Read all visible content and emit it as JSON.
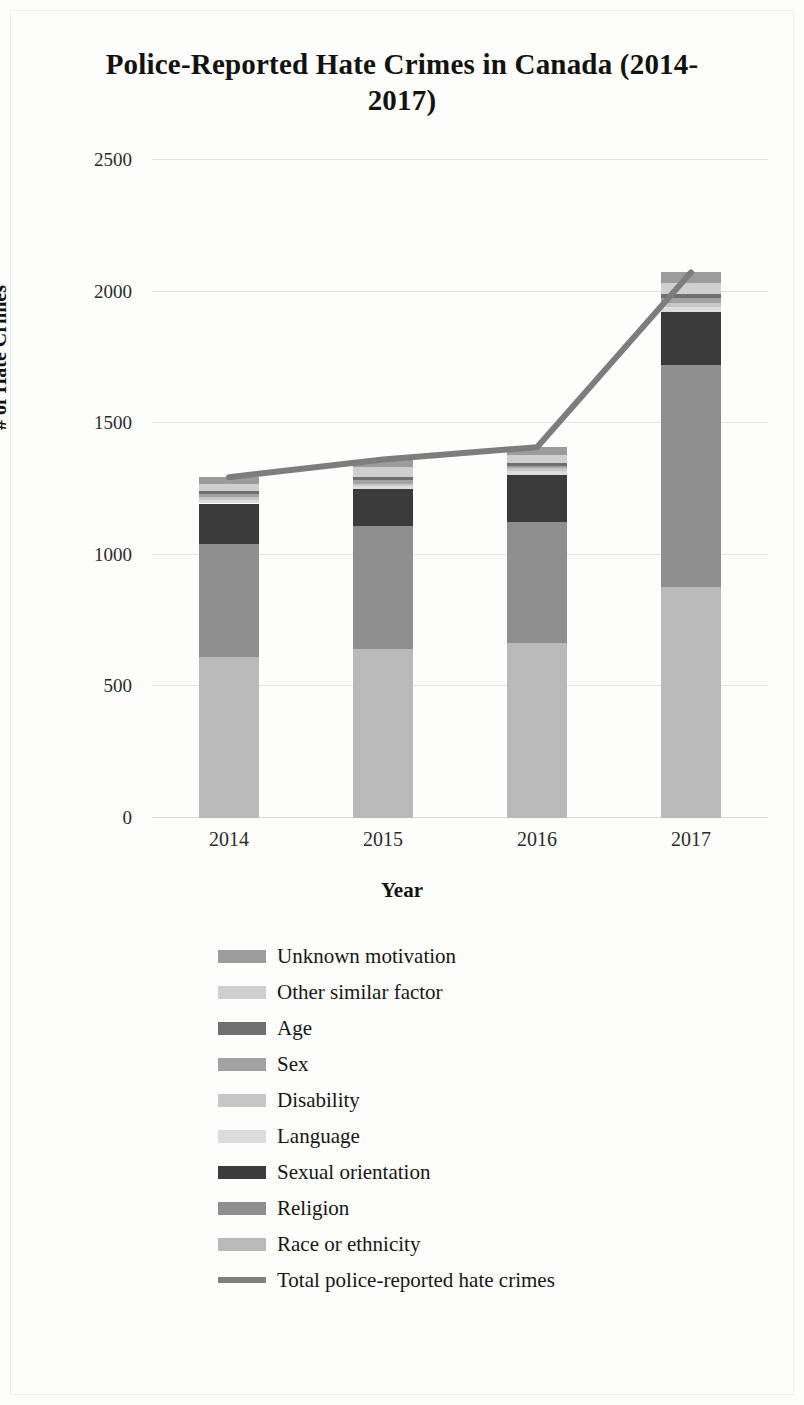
{
  "chart_data": {
    "type": "bar",
    "subtype": "stacked-bar-with-line-overlay",
    "title": "Police-Reported Hate Crimes in Canada (2014-2017)",
    "xlabel": "Year",
    "ylabel": "# of Hate Crimes",
    "categories": [
      "2014",
      "2015",
      "2016",
      "2017"
    ],
    "ylim": [
      0,
      2500
    ],
    "yticks": [
      "0",
      "500",
      "1000",
      "1500",
      "2000",
      "2500"
    ],
    "ytick_values": [
      0,
      500,
      1000,
      1500,
      2000,
      2500
    ],
    "grid": true,
    "legend_position": "bottom",
    "stack_order_bottom_to_top": [
      "Race or ethnicity",
      "Religion",
      "Sexual orientation",
      "Language",
      "Disability",
      "Sex",
      "Age",
      "Other similar factor",
      "Unknown motivation"
    ],
    "series": [
      {
        "name": "Race or ethnicity",
        "color": "#b9b9b9",
        "values": [
          611,
          641,
          666,
          878
        ]
      },
      {
        "name": "Religion",
        "color": "#8f8f8f",
        "values": [
          429,
          469,
          460,
          842
        ]
      },
      {
        "name": "Sexual orientation",
        "color": "#3b3b3b",
        "values": [
          155,
          141,
          176,
          204
        ]
      },
      {
        "name": "Language",
        "color": "#dcdcdc",
        "values": [
          14,
          10,
          15,
          17
        ]
      },
      {
        "name": "Disability",
        "color": "#c6c6c6",
        "values": [
          9,
          9,
          12,
          16
        ]
      },
      {
        "name": "Sex",
        "color": "#a2a2a2",
        "values": [
          14,
          15,
          10,
          18
        ]
      },
      {
        "name": "Age",
        "color": "#6f6f6f",
        "values": [
          10,
          12,
          11,
          17
        ]
      },
      {
        "name": "Other similar factor",
        "color": "#cfcfcf",
        "values": [
          28,
          37,
          28,
          41
        ]
      },
      {
        "name": "Unknown motivation",
        "color": "#9c9c9c",
        "values": [
          25,
          28,
          31,
          40
        ]
      }
    ],
    "line_series": {
      "name": "Total police-reported hate crimes",
      "color": "#7d7d7d",
      "values": [
        1295,
        1362,
        1409,
        2073
      ]
    }
  },
  "legend": {
    "items": [
      {
        "label": "Unknown motivation",
        "color": "#9c9c9c",
        "kind": "swatch"
      },
      {
        "label": "Other similar factor",
        "color": "#cfcfcf",
        "kind": "swatch"
      },
      {
        "label": "Age",
        "color": "#6f6f6f",
        "kind": "swatch"
      },
      {
        "label": "Sex",
        "color": "#a2a2a2",
        "kind": "swatch"
      },
      {
        "label": "Disability",
        "color": "#c6c6c6",
        "kind": "swatch"
      },
      {
        "label": "Language",
        "color": "#dcdcdc",
        "kind": "swatch"
      },
      {
        "label": "Sexual orientation",
        "color": "#3b3b3b",
        "kind": "swatch"
      },
      {
        "label": "Religion",
        "color": "#8f8f8f",
        "kind": "swatch"
      },
      {
        "label": "Race or ethnicity",
        "color": "#b9b9b9",
        "kind": "swatch"
      },
      {
        "label": "Total police-reported hate crimes",
        "color": "#7d7d7d",
        "kind": "line"
      }
    ]
  }
}
